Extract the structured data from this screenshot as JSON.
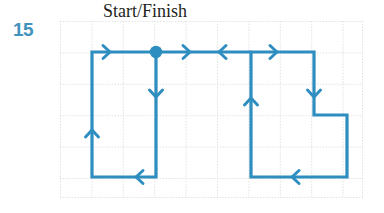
{
  "problem": {
    "number": "15",
    "number_color": "#3f93bd"
  },
  "figure": {
    "type": "grid-path-diagram",
    "label": "Start/Finish",
    "label_color": "#231f20",
    "path_color": "#2e8ec0",
    "grid_color": "#b9b9b9",
    "grid": {
      "origin_x": 60,
      "origin_y": 21,
      "cell": 31.4,
      "cols": 9,
      "rows": 5.6,
      "style": "dotted"
    },
    "start_point": {
      "col": 3,
      "row": 1
    },
    "segments": [
      {
        "name": "left-loop-top",
        "from": [
          1,
          1
        ],
        "to": [
          3,
          1
        ],
        "dir": "right"
      },
      {
        "name": "left-loop-top-right",
        "from": [
          3,
          1
        ],
        "to": [
          5,
          1
        ],
        "dir": "right"
      },
      {
        "name": "upper-bridge-back",
        "from": [
          5,
          1
        ],
        "to": [
          6,
          1
        ],
        "dir": "left"
      },
      {
        "name": "right-loop-top",
        "from": [
          6,
          1
        ],
        "to": [
          8,
          1
        ],
        "dir": "right"
      },
      {
        "name": "right-loop-right-down",
        "from": [
          8,
          1
        ],
        "to": [
          8,
          4
        ],
        "dir": "down"
      },
      {
        "name": "right-notch-across",
        "from": [
          8,
          4
        ],
        "to": [
          9.6,
          4
        ],
        "dir": "right"
      },
      {
        "name": "right-notch-down",
        "from": [
          9.6,
          4
        ],
        "to": [
          9.6,
          5
        ],
        "dir": "down"
      },
      {
        "name": "right-loop-bottom",
        "from": [
          9.6,
          5
        ],
        "to": [
          6,
          5
        ],
        "dir": "left"
      },
      {
        "name": "right-loop-left-up",
        "from": [
          6,
          5
        ],
        "to": [
          6,
          1
        ],
        "dir": "up"
      },
      {
        "name": "left-loop-right-down",
        "from": [
          3,
          1
        ],
        "to": [
          3,
          5
        ],
        "dir": "down"
      },
      {
        "name": "left-loop-bottom",
        "from": [
          3,
          5
        ],
        "to": [
          1,
          5
        ],
        "dir": "left"
      },
      {
        "name": "left-loop-left-up",
        "from": [
          1,
          5
        ],
        "to": [
          1,
          1
        ],
        "dir": "up"
      }
    ],
    "arrows": [
      {
        "name": "arrow-top-left-right",
        "x": 108,
        "y": 52,
        "dir": "right"
      },
      {
        "name": "arrow-top-mid-right",
        "x": 188,
        "y": 52,
        "dir": "right"
      },
      {
        "name": "arrow-top-bridge-left",
        "x": 221,
        "y": 52,
        "dir": "left"
      },
      {
        "name": "arrow-top-right-right",
        "x": 275,
        "y": 52,
        "dir": "right"
      },
      {
        "name": "arrow-left-down",
        "x": 156,
        "y": 96,
        "dir": "down"
      },
      {
        "name": "arrow-left-up",
        "x": 92,
        "y": 130,
        "dir": "up"
      },
      {
        "name": "arrow-left-bottom-left",
        "x": 136,
        "y": 177,
        "dir": "left"
      },
      {
        "name": "arrow-right-up",
        "x": 251,
        "y": 98,
        "dir": "up"
      },
      {
        "name": "arrow-right-down",
        "x": 314,
        "y": 96,
        "dir": "down"
      },
      {
        "name": "arrow-right-bottom-left",
        "x": 292,
        "y": 177,
        "dir": "left"
      }
    ]
  }
}
